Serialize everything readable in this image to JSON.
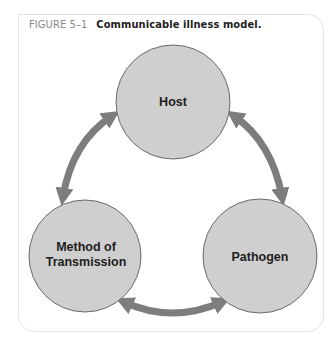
{
  "figure": {
    "label": "FIGURE 5–1",
    "title": "Communicable illness model."
  },
  "diagram": {
    "nodes": [
      {
        "id": "host",
        "lines": [
          "Host"
        ]
      },
      {
        "id": "pathogen",
        "lines": [
          "Pathogen"
        ]
      },
      {
        "id": "method",
        "lines": [
          "Method of",
          "Transmission"
        ]
      }
    ],
    "edges": [
      {
        "from": "method",
        "to": "host",
        "type": "bidirectional"
      },
      {
        "from": "host",
        "to": "pathogen",
        "type": "bidirectional"
      },
      {
        "from": "method",
        "to": "pathogen",
        "type": "bidirectional"
      }
    ],
    "colors": {
      "node_fill": "#cfcfcf",
      "node_stroke": "#6a6a6a",
      "arrow": "#7d7d7d",
      "text": "#1e1e1e"
    }
  }
}
